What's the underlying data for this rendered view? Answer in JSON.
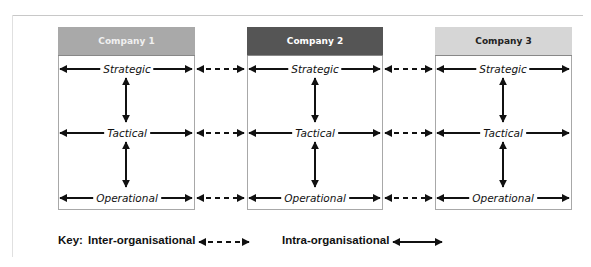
{
  "companies": [
    {
      "label": "Company 1",
      "header_color": "#a9a9a9",
      "text_color": "#f0f0f0",
      "left": 58,
      "right": 194
    },
    {
      "label": "Company 2",
      "header_color": "#555555",
      "text_color": "#ffffff",
      "left": 247,
      "right": 382
    },
    {
      "label": "Company 3",
      "header_color": "#d6d6d6",
      "text_color": "#222222",
      "left": 435,
      "right": 571
    }
  ],
  "levels": [
    "Strategic",
    "Tactical",
    "Operational"
  ],
  "key": {
    "prefix": "Key:",
    "inter_label": "Inter-organisational",
    "intra_label": "Intra-organisational"
  }
}
